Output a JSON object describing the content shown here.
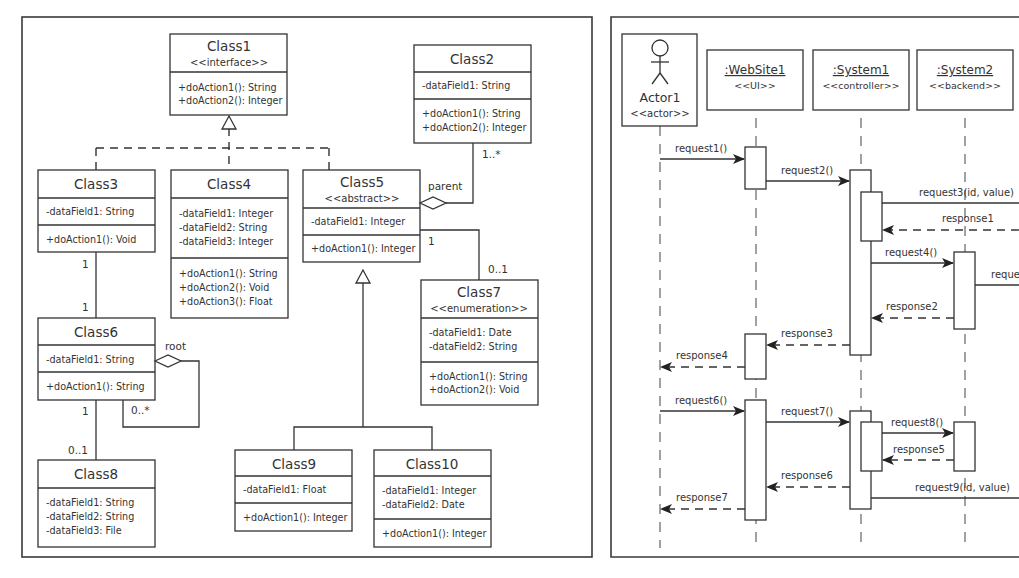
{
  "class_diagram": {
    "classes": [
      {
        "id": "class1",
        "name": "Class1",
        "stereotype": "<<interface>>",
        "fields": [],
        "methods": [
          "+doAction1(): String",
          "+doAction2(): Integer"
        ]
      },
      {
        "id": "class2",
        "name": "Class2",
        "stereotype": "",
        "fields": [
          "-dataField1: String"
        ],
        "methods": [
          "+doAction1(): String",
          "+doAction2(): Integer"
        ]
      },
      {
        "id": "class3",
        "name": "Class3",
        "stereotype": "",
        "fields": [
          "-dataField1: String"
        ],
        "methods": [
          "+doAction1(): Void"
        ]
      },
      {
        "id": "class4",
        "name": "Class4",
        "stereotype": "",
        "fields": [
          "-dataField1: Integer",
          "-dataField2: String",
          "-dataField3: Integer"
        ],
        "methods": [
          "+doAction1(): String",
          "+doAction2(): Void",
          "+doAction3(): Float"
        ]
      },
      {
        "id": "class5",
        "name": "Class5",
        "stereotype": "<<abstract>>",
        "fields": [
          "-dataField1: Integer"
        ],
        "methods": [
          "+doAction1(): Integer"
        ]
      },
      {
        "id": "class6",
        "name": "Class6",
        "stereotype": "",
        "fields": [
          "-dataField1: String"
        ],
        "methods": [
          "+doAction1(): String"
        ]
      },
      {
        "id": "class7",
        "name": "Class7",
        "stereotype": "<<enumeration>>",
        "fields": [
          "-dataField1: Date",
          "-dataField2: String"
        ],
        "methods": [
          "+doAction1(): String",
          "+doAction2(): Void"
        ]
      },
      {
        "id": "class8",
        "name": "Class8",
        "stereotype": "",
        "fields": [
          "-dataField1: String",
          "-dataField2: String",
          "-dataField3: File"
        ],
        "methods": []
      },
      {
        "id": "class9",
        "name": "Class9",
        "stereotype": "",
        "fields": [
          "-dataField1: Float"
        ],
        "methods": [
          "+doAction1(): Integer"
        ]
      },
      {
        "id": "class10",
        "name": "Class10",
        "stereotype": "",
        "fields": [
          "-dataField1: Integer",
          "-dataField2: Date"
        ],
        "methods": [
          "+doAction1(): Integer"
        ]
      }
    ],
    "relations": {
      "class3_class6": {
        "from_mult": "1",
        "to_mult": "1"
      },
      "class6_class8": {
        "from_mult": "1",
        "to_mult": "0..1"
      },
      "class6_self": {
        "role": "root",
        "mult": "0..*"
      },
      "class2_class5": {
        "role": "parent",
        "mult": "1..*"
      },
      "class5_class7": {
        "from_mult": "1",
        "to_mult": "0..1"
      }
    }
  },
  "sequence_diagram": {
    "participants": [
      {
        "name": "Actor1",
        "stereotype": "<<actor>>",
        "kind": "actor-icon"
      },
      {
        "name": ":WebSite1",
        "stereotype": "<<UI>>"
      },
      {
        "name": ":System1",
        "stereotype": "<<controller>>"
      },
      {
        "name": ":System2",
        "stereotype": "<<backend>>"
      }
    ],
    "messages": [
      {
        "label": "request1()",
        "type": "sync"
      },
      {
        "label": "request2()",
        "type": "sync"
      },
      {
        "label": "request3(id, value)",
        "type": "sync"
      },
      {
        "label": "response1",
        "type": "return"
      },
      {
        "label": "request4()",
        "type": "sync"
      },
      {
        "label": "reque",
        "type": "sync"
      },
      {
        "label": "response2",
        "type": "return"
      },
      {
        "label": "response3",
        "type": "return"
      },
      {
        "label": "response4",
        "type": "return"
      },
      {
        "label": "request6()",
        "type": "sync"
      },
      {
        "label": "request7()",
        "type": "sync"
      },
      {
        "label": "request8()",
        "type": "sync"
      },
      {
        "label": "response5",
        "type": "return"
      },
      {
        "label": "response6",
        "type": "return"
      },
      {
        "label": "request9(id, value)",
        "type": "sync"
      },
      {
        "label": "response7",
        "type": "return"
      }
    ]
  }
}
